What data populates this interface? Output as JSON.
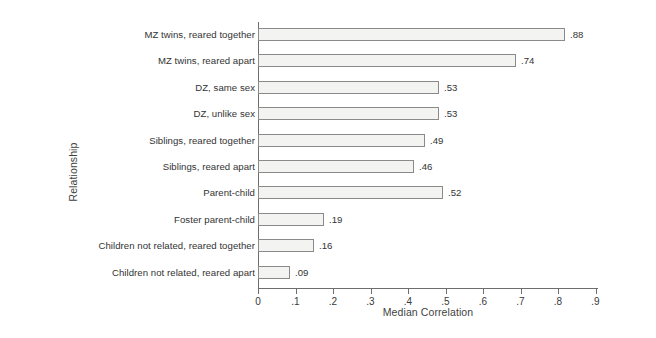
{
  "chart_data": {
    "type": "bar",
    "orientation": "horizontal",
    "title": "",
    "xlabel": "Median Correlation",
    "ylabel": "Relationship",
    "xlim": [
      0,
      0.9
    ],
    "grid": false,
    "legend": null,
    "categories": [
      "MZ twins, reared together",
      "MZ twins, reared apart",
      "DZ, same sex",
      "DZ, unlike sex",
      "Siblings, reared together",
      "Siblings, reared apart",
      "Parent-child",
      "Foster parent-child",
      "Children not related, reared together",
      "Children not related, reared apart"
    ],
    "values": [
      0.88,
      0.74,
      0.53,
      0.53,
      0.49,
      0.46,
      0.52,
      0.19,
      0.16,
      0.09
    ],
    "value_labels": [
      ".88",
      ".74",
      ".53",
      ".53",
      ".49",
      ".46",
      ".52",
      ".19",
      ".16",
      ".09"
    ],
    "bar_pixel_lengths": [
      307,
      258,
      181,
      181,
      167,
      156,
      185,
      66,
      56,
      32
    ],
    "xticks": [
      0,
      0.1,
      0.2,
      0.3,
      0.4,
      0.5,
      0.6,
      0.7,
      0.8,
      0.9
    ],
    "xtick_labels": [
      "0",
      ".1",
      ".2",
      ".3",
      ".4",
      ".5",
      ".6",
      ".7",
      ".8",
      ".9"
    ],
    "colors": {
      "bar_fill": "#f3f3f1",
      "bar_border": "#8a8a8a",
      "axis": "#6d6d6d",
      "text": "#333333",
      "background": "#ffffff"
    }
  }
}
